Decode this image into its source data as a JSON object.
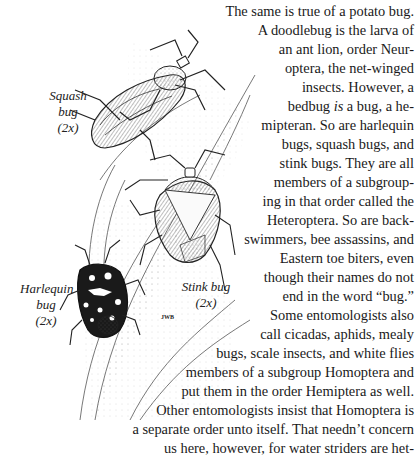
{
  "body_text": {
    "lines": [
      "The same is true of a potato bug.",
      "A doodlebug is the larva of",
      "an ant lion, order Neur-",
      "optera, the net-winged",
      "insects. However, a",
      "bedbug is a bug, a he-",
      "mipteran. So are harlequin",
      "bugs, squash bugs, and",
      "stink bugs. They are all",
      "members of a subgroup-",
      "ing in that order called the",
      "Heteroptera. So are back-",
      "swimmers, bee assassins, and",
      "Eastern toe biters, even",
      "though their names do not",
      "end in the word “bug.”",
      "Some entomologists also",
      "call cicadas, aphids, mealy",
      "bugs, scale insects, and white flies",
      "members of a subgroup Homoptera and",
      "put them in the order Hemiptera as well.",
      "Other entomologists insist that Homoptera is",
      "a separate order unto itself. That needn’t concern",
      "us here, however, for water striders are het-"
    ],
    "italic_word_line5": {
      "before": "bedbug ",
      "italic": "is",
      "after": " a bug, a he-"
    }
  },
  "illustration": {
    "description": "Pen-and-ink stipple drawing of three bugs on plant stems",
    "captions": {
      "squash_bug": {
        "name": "Squash bug",
        "scale": "(2x)"
      },
      "stink_bug": {
        "name": "Stink bug",
        "scale": "(2x)"
      },
      "harlequin_bug": {
        "name": "Harlequin",
        "name2": "bug",
        "scale": "(2x)"
      }
    },
    "signature": "JWB"
  }
}
